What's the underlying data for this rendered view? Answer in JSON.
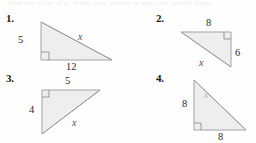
{
  "page": {
    "background_color": "#fefefe",
    "ghost_header_text": "Find the value of x. Write your answer in simplest radical form.",
    "triangle_fill": "#eeeeee",
    "triangle_stroke": "#9a9a9a",
    "label_color": "#2a2a2a",
    "variable_color": "#4a4a4a"
  },
  "problems": [
    {
      "number": "1.",
      "right_angle_position": "bottom-left",
      "labels": {
        "leg_vertical": "5",
        "leg_horizontal": "12",
        "hypotenuse": "x"
      }
    },
    {
      "number": "2.",
      "right_angle_position": "top-right",
      "labels": {
        "leg_horizontal": "8",
        "leg_vertical": "6",
        "hypotenuse": "x"
      }
    },
    {
      "number": "3.",
      "right_angle_position": "top-left",
      "labels": {
        "leg_horizontal": "5",
        "leg_vertical": "4",
        "hypotenuse": "x"
      }
    },
    {
      "number": "4.",
      "right_angle_position": "bottom-left",
      "labels": {
        "leg_vertical": "8",
        "leg_horizontal": "8",
        "hypotenuse": "x"
      }
    }
  ]
}
